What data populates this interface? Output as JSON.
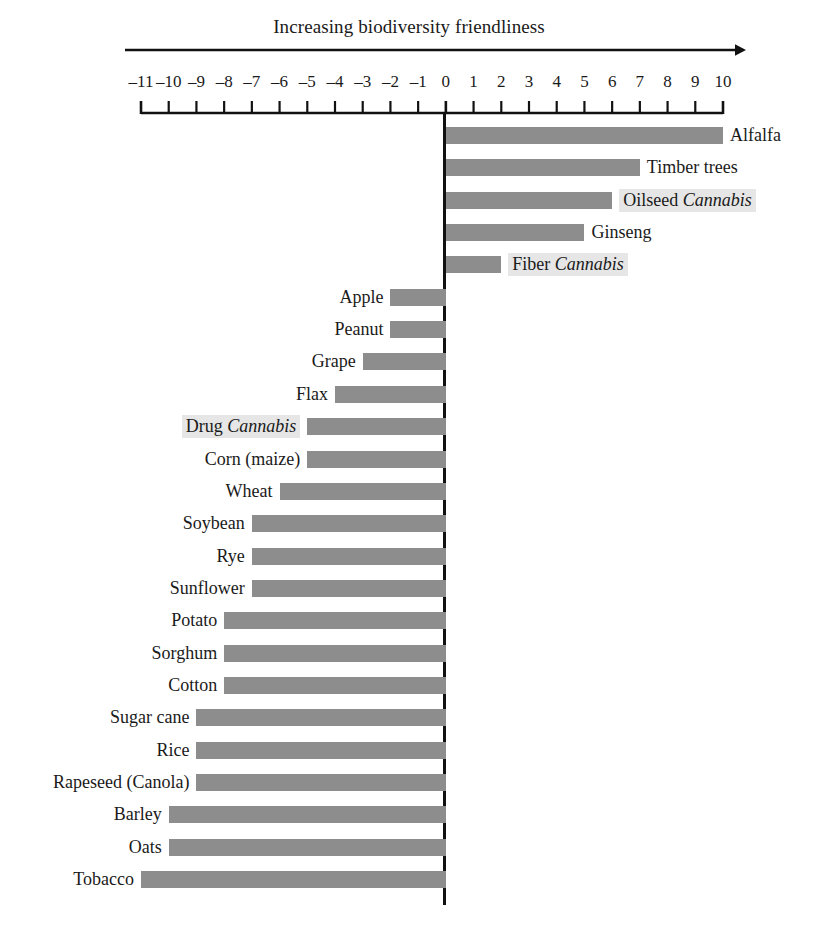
{
  "chart_data": {
    "type": "bar",
    "orientation": "horizontal",
    "title": "Increasing biodiversity friendliness",
    "xlabel": "",
    "ylabel": "",
    "xlim": [
      -11,
      10
    ],
    "grid": false,
    "legend": null,
    "axis_ticks": [
      -11,
      -10,
      -9,
      -8,
      -7,
      -6,
      -5,
      -4,
      -3,
      -2,
      -1,
      0,
      1,
      2,
      3,
      4,
      5,
      6,
      7,
      8,
      9,
      10
    ],
    "axis_tick_labels": [
      "–11",
      "–10",
      "–9",
      "–8",
      "–7",
      "–6",
      "–5",
      "–4",
      "–3",
      "–2",
      "–1",
      "0",
      "1",
      "2",
      "3",
      "4",
      "5",
      "6",
      "7",
      "8",
      "9",
      "10"
    ],
    "bar_color": "#8d8d8d",
    "highlight_color": "#e6e6e6",
    "axis_color": "#111111",
    "categories": [
      "Alfalfa",
      "Timber trees",
      "Oilseed Cannabis",
      "Ginseng",
      "Fiber Cannabis",
      "Apple",
      "Peanut",
      "Grape",
      "Flax",
      "Drug Cannabis",
      "Corn (maize)",
      "Wheat",
      "Soybean",
      "Rye",
      "Sunflower",
      "Potato",
      "Sorghum",
      "Cotton",
      "Sugar cane",
      "Rice",
      "Rapeseed (Canola)",
      "Barley",
      "Oats",
      "Tobacco"
    ],
    "values": [
      10,
      7,
      6,
      5,
      2,
      -2,
      -2,
      -3,
      -4,
      -5,
      -5,
      -6,
      -7,
      -7,
      -7,
      -8,
      -8,
      -8,
      -9,
      -9,
      -9,
      -10,
      -10,
      -11
    ]
  },
  "bars": [
    {
      "label_plain": "Alfalfa",
      "label_pre": "Alfalfa",
      "label_italic": "",
      "value": 10,
      "highlight": false
    },
    {
      "label_plain": "Timber trees",
      "label_pre": "Timber trees",
      "label_italic": "",
      "value": 7,
      "highlight": false
    },
    {
      "label_plain": "Oilseed Cannabis",
      "label_pre": "Oilseed ",
      "label_italic": "Cannabis",
      "value": 6,
      "highlight": true
    },
    {
      "label_plain": "Ginseng",
      "label_pre": "Ginseng",
      "label_italic": "",
      "value": 5,
      "highlight": false
    },
    {
      "label_plain": "Fiber Cannabis",
      "label_pre": "Fiber ",
      "label_italic": "Cannabis",
      "value": 2,
      "highlight": true
    },
    {
      "label_plain": "Apple",
      "label_pre": "Apple",
      "label_italic": "",
      "value": -2,
      "highlight": false
    },
    {
      "label_plain": "Peanut",
      "label_pre": "Peanut",
      "label_italic": "",
      "value": -2,
      "highlight": false
    },
    {
      "label_plain": "Grape",
      "label_pre": "Grape",
      "label_italic": "",
      "value": -3,
      "highlight": false
    },
    {
      "label_plain": "Flax",
      "label_pre": "Flax",
      "label_italic": "",
      "value": -4,
      "highlight": false
    },
    {
      "label_plain": "Drug Cannabis",
      "label_pre": "Drug ",
      "label_italic": "Cannabis",
      "value": -5,
      "highlight": true
    },
    {
      "label_plain": "Corn (maize)",
      "label_pre": "Corn (maize)",
      "label_italic": "",
      "value": -5,
      "highlight": false
    },
    {
      "label_plain": "Wheat",
      "label_pre": "Wheat",
      "label_italic": "",
      "value": -6,
      "highlight": false
    },
    {
      "label_plain": "Soybean",
      "label_pre": "Soybean",
      "label_italic": "",
      "value": -7,
      "highlight": false
    },
    {
      "label_plain": "Rye",
      "label_pre": "Rye",
      "label_italic": "",
      "value": -7,
      "highlight": false
    },
    {
      "label_plain": "Sunflower",
      "label_pre": "Sunflower",
      "label_italic": "",
      "value": -7,
      "highlight": false
    },
    {
      "label_plain": "Potato",
      "label_pre": "Potato",
      "label_italic": "",
      "value": -8,
      "highlight": false
    },
    {
      "label_plain": "Sorghum",
      "label_pre": "Sorghum",
      "label_italic": "",
      "value": -8,
      "highlight": false
    },
    {
      "label_plain": "Cotton",
      "label_pre": "Cotton",
      "label_italic": "",
      "value": -8,
      "highlight": false
    },
    {
      "label_plain": "Sugar cane",
      "label_pre": "Sugar cane",
      "label_italic": "",
      "value": -9,
      "highlight": false
    },
    {
      "label_plain": "Rice",
      "label_pre": "Rice",
      "label_italic": "",
      "value": -9,
      "highlight": false
    },
    {
      "label_plain": "Rapeseed (Canola)",
      "label_pre": "Rapeseed (Canola)",
      "label_italic": "",
      "value": -9,
      "highlight": false
    },
    {
      "label_plain": "Barley",
      "label_pre": "Barley",
      "label_italic": "",
      "value": -10,
      "highlight": false
    },
    {
      "label_plain": "Oats",
      "label_pre": "Oats",
      "label_italic": "",
      "value": -10,
      "highlight": false
    },
    {
      "label_plain": "Tobacco",
      "label_pre": "Tobacco",
      "label_italic": "",
      "value": -11,
      "highlight": false
    }
  ],
  "geometry": {
    "x_at_min": 141,
    "x_at_max": 723,
    "x_zero": 444.5,
    "first_bar_top": 127,
    "bar_height": 17,
    "bar_pitch": 32.35,
    "axis_line_y": 113,
    "arrow_y": 50,
    "arrow_x1": 125,
    "arrow_x2": 746
  }
}
